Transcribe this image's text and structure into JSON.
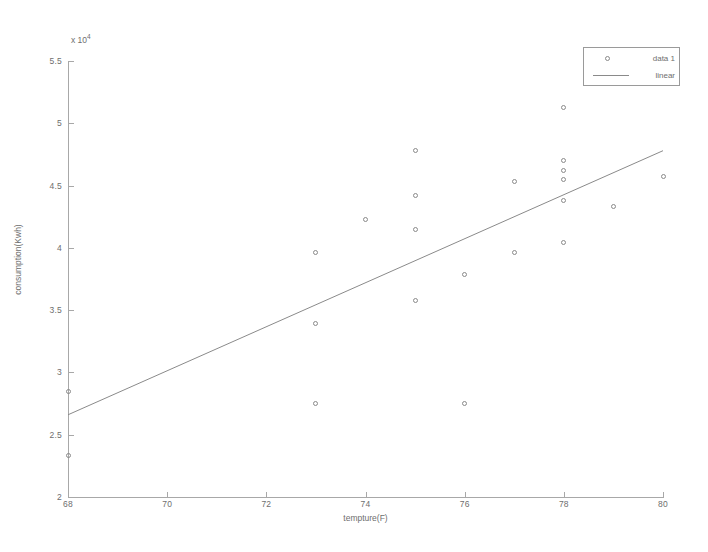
{
  "chart_data": {
    "type": "scatter",
    "title": "",
    "xlabel": "tempture(F)",
    "ylabel": "consumption(Kwh)",
    "y_exponent_label": "x 10",
    "y_exponent_power": "4",
    "y_scale_factor": 10000,
    "xlim": [
      68,
      80
    ],
    "ylim": [
      2,
      5.5
    ],
    "xticks": [
      68,
      70,
      72,
      74,
      76,
      78,
      80
    ],
    "xtick_labels": [
      "68",
      "70",
      "72",
      "74",
      "76",
      "78",
      "80"
    ],
    "yticks": [
      2,
      2.5,
      3,
      3.5,
      4,
      4.5,
      5,
      5.5
    ],
    "ytick_labels": [
      "2",
      "2.5",
      "3",
      "3.5",
      "4",
      "4.5",
      "5",
      "5.5"
    ],
    "grid": false,
    "legend_position": "top-right",
    "marker_color": "#8a8a8a",
    "line_color": "#8a8a8a",
    "axis_color": "#a8a8a8",
    "series": [
      {
        "name": "data 1",
        "type": "scatter",
        "marker": "circle-open",
        "points": [
          {
            "x": 68,
            "y": 2.85
          },
          {
            "x": 68,
            "y": 2.33
          },
          {
            "x": 73,
            "y": 3.96
          },
          {
            "x": 73,
            "y": 3.39
          },
          {
            "x": 73,
            "y": 2.75
          },
          {
            "x": 74,
            "y": 4.23
          },
          {
            "x": 75,
            "y": 4.78
          },
          {
            "x": 75,
            "y": 4.42
          },
          {
            "x": 75,
            "y": 4.15
          },
          {
            "x": 75,
            "y": 3.58
          },
          {
            "x": 76,
            "y": 3.79
          },
          {
            "x": 76,
            "y": 2.75
          },
          {
            "x": 77,
            "y": 4.53
          },
          {
            "x": 77,
            "y": 3.96
          },
          {
            "x": 78,
            "y": 5.13
          },
          {
            "x": 78,
            "y": 4.7
          },
          {
            "x": 78,
            "y": 4.62
          },
          {
            "x": 78,
            "y": 4.55
          },
          {
            "x": 78,
            "y": 4.38
          },
          {
            "x": 78,
            "y": 4.04
          },
          {
            "x": 79,
            "y": 4.33
          },
          {
            "x": 80,
            "y": 4.57
          }
        ]
      },
      {
        "name": "linear",
        "type": "line",
        "endpoints": [
          {
            "x": 68,
            "y": 2.66
          },
          {
            "x": 80,
            "y": 4.78
          }
        ]
      }
    ]
  },
  "legend": {
    "entries": [
      {
        "label": "data 1",
        "sample": "marker"
      },
      {
        "label": "linear",
        "sample": "line"
      }
    ]
  }
}
